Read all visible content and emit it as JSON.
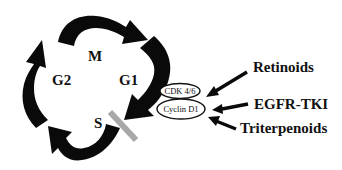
{
  "diagram": {
    "phases": {
      "m": "M",
      "g1": "G1",
      "s": "S",
      "g2": "G2"
    },
    "complex": {
      "cdk": "CDK 4/6",
      "cyclin": "Cyclin D1"
    },
    "agents": {
      "retinoids": "Retinoids",
      "egfr": "EGFR-TKI",
      "triterpenoids": "Triterpenoids"
    },
    "colors": {
      "arrow": "#0a0a0a",
      "checkpoint_bar": "#a8a8a8",
      "text": "#111111",
      "background": "#ffffff"
    }
  }
}
